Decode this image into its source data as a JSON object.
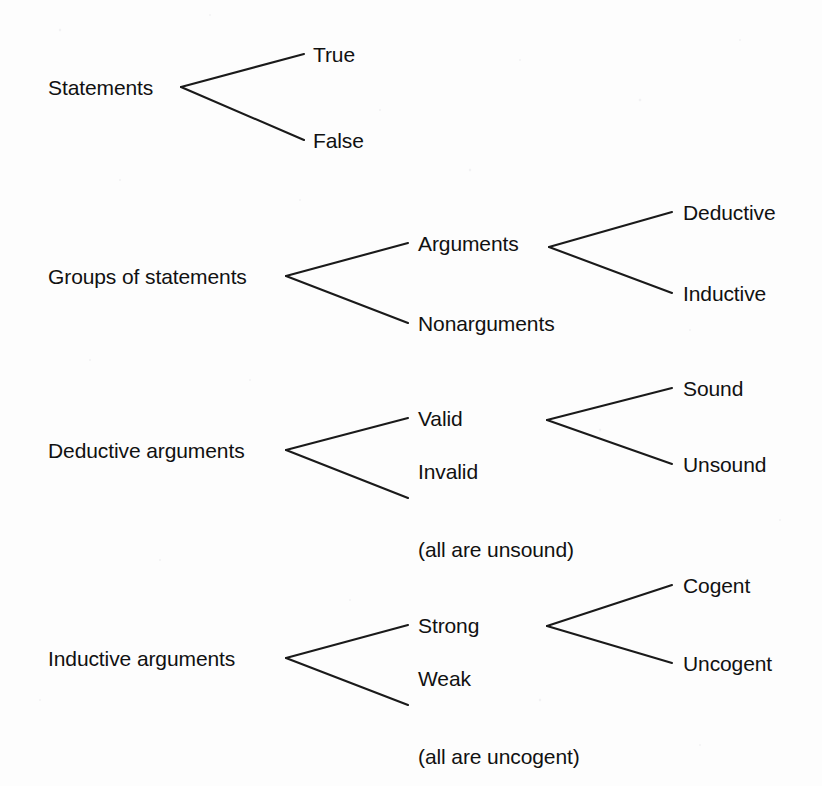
{
  "diagram": {
    "type": "classification-tree",
    "background_color": "#fdfdfd",
    "line_color": "#1a1a1a",
    "text_color": "#111111",
    "groups": [
      {
        "id": "statements",
        "root": {
          "label": "Statements",
          "x": 48,
          "y": 87
        },
        "vertex": {
          "x": 181,
          "y": 87
        },
        "children": [
          {
            "label": "True",
            "x": 313,
            "y": 54,
            "line_end_x": 304
          },
          {
            "label": "False",
            "x": 313,
            "y": 140,
            "line_end_x": 304
          }
        ]
      },
      {
        "id": "groups-of-statements",
        "root": {
          "label": "Groups of statements",
          "x": 48,
          "y": 276
        },
        "vertex": {
          "x": 286,
          "y": 276
        },
        "children": [
          {
            "label": "Arguments",
            "x": 418,
            "y": 243,
            "line_end_x": 408,
            "vertex": {
              "x": 549,
              "y": 247
            },
            "children": [
              {
                "label": "Deductive",
                "x": 683,
                "y": 212,
                "line_end_x": 672
              },
              {
                "label": "Inductive",
                "x": 683,
                "y": 293,
                "line_end_x": 672
              }
            ]
          },
          {
            "label": "Nonarguments",
            "x": 418,
            "y": 323,
            "line_end_x": 408
          }
        ]
      },
      {
        "id": "deductive-arguments",
        "root": {
          "label": "Deductive arguments",
          "x": 48,
          "y": 450
        },
        "vertex": {
          "x": 286,
          "y": 450
        },
        "children": [
          {
            "label": "Valid",
            "x": 418,
            "y": 418,
            "line_end_x": 408,
            "vertex": {
              "x": 547,
              "y": 420
            },
            "children": [
              {
                "label": "Sound",
                "x": 683,
                "y": 388,
                "line_end_x": 672
              },
              {
                "label": "Unsound",
                "x": 683,
                "y": 464,
                "line_end_x": 672
              }
            ]
          },
          {
            "label": "Invalid",
            "sub_label": "(all are unsound)",
            "x": 418,
            "y": 498,
            "line_end_x": 408
          }
        ]
      },
      {
        "id": "inductive-arguments",
        "root": {
          "label": "Inductive arguments",
          "x": 48,
          "y": 658
        },
        "vertex": {
          "x": 286,
          "y": 658
        },
        "children": [
          {
            "label": "Strong",
            "x": 418,
            "y": 625,
            "line_end_x": 408,
            "vertex": {
              "x": 547,
              "y": 626
            },
            "children": [
              {
                "label": "Cogent",
                "x": 683,
                "y": 585,
                "line_end_x": 672
              },
              {
                "label": "Uncogent",
                "x": 683,
                "y": 663,
                "line_end_x": 672
              }
            ]
          },
          {
            "label": "Weak",
            "sub_label": "(all are uncogent)",
            "x": 418,
            "y": 705,
            "line_end_x": 408
          }
        ]
      }
    ]
  },
  "labels": {
    "statements": "Statements",
    "true": "True",
    "false": "False",
    "groups_of_statements": "Groups of statements",
    "arguments": "Arguments",
    "nonarguments": "Nonarguments",
    "deductive": "Deductive",
    "inductive": "Inductive",
    "deductive_arguments": "Deductive arguments",
    "valid": "Valid",
    "invalid": "Invalid",
    "invalid_note": "(all are unsound)",
    "sound": "Sound",
    "unsound": "Unsound",
    "inductive_arguments": "Inductive arguments",
    "strong": "Strong",
    "weak": "Weak",
    "weak_note": "(all are uncogent)",
    "cogent": "Cogent",
    "uncogent": "Uncogent"
  }
}
